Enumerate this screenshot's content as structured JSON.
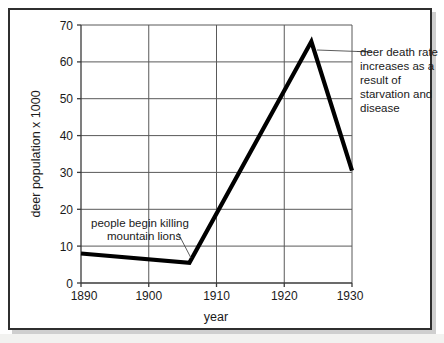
{
  "chart_data": {
    "type": "line",
    "title": "",
    "xlabel": "year",
    "ylabel": "deer population x 1000",
    "xlim": [
      1890,
      1930
    ],
    "ylim": [
      0,
      70
    ],
    "xticks": [
      1890,
      1900,
      1910,
      1920,
      1930
    ],
    "yticks": [
      0,
      10,
      20,
      30,
      40,
      50,
      60,
      70
    ],
    "grid": true,
    "legend": false,
    "series": [
      {
        "name": "deer population",
        "x": [
          1890,
          1906,
          1924,
          1930
        ],
        "values": [
          8,
          5.5,
          65.5,
          30.5
        ]
      }
    ],
    "annotations": [
      {
        "id": "annotation-death-rate",
        "lines": [
          "deer death rate",
          "increases as a",
          "result of",
          "starvation and",
          "disease"
        ],
        "text": "deer death rate increases as a result of starvation and disease",
        "points_to_x": 1924,
        "points_to_y": 58
      },
      {
        "id": "annotation-mountain-lions",
        "lines": [
          "people begin killing",
          "mountain lions"
        ],
        "text": "people begin killing mountain lions",
        "points_to_x": 1906,
        "points_to_y": 6
      }
    ]
  },
  "axis": {
    "y_title": "deer population x 1000",
    "x_title": "year",
    "y_tick_labels": [
      "70",
      "60",
      "50",
      "40",
      "30",
      "20",
      "10",
      "0"
    ],
    "x_tick_labels": [
      "1890",
      "1900",
      "1910",
      "1920",
      "1930"
    ]
  },
  "annotations": {
    "death_rate": {
      "line1": "deer death rate",
      "line2": "increases as a",
      "line3": "result of",
      "line4": "starvation and",
      "line5": "disease"
    },
    "mountain_lions": {
      "line1": "people begin killing",
      "line2": "mountain lions"
    }
  },
  "colors": {
    "data_line": "#000000",
    "grid": "#595959",
    "axis": "#3a3a3a",
    "frame": "#2f2f2f",
    "background": "#ffffff",
    "text": "#1a1a1a"
  }
}
